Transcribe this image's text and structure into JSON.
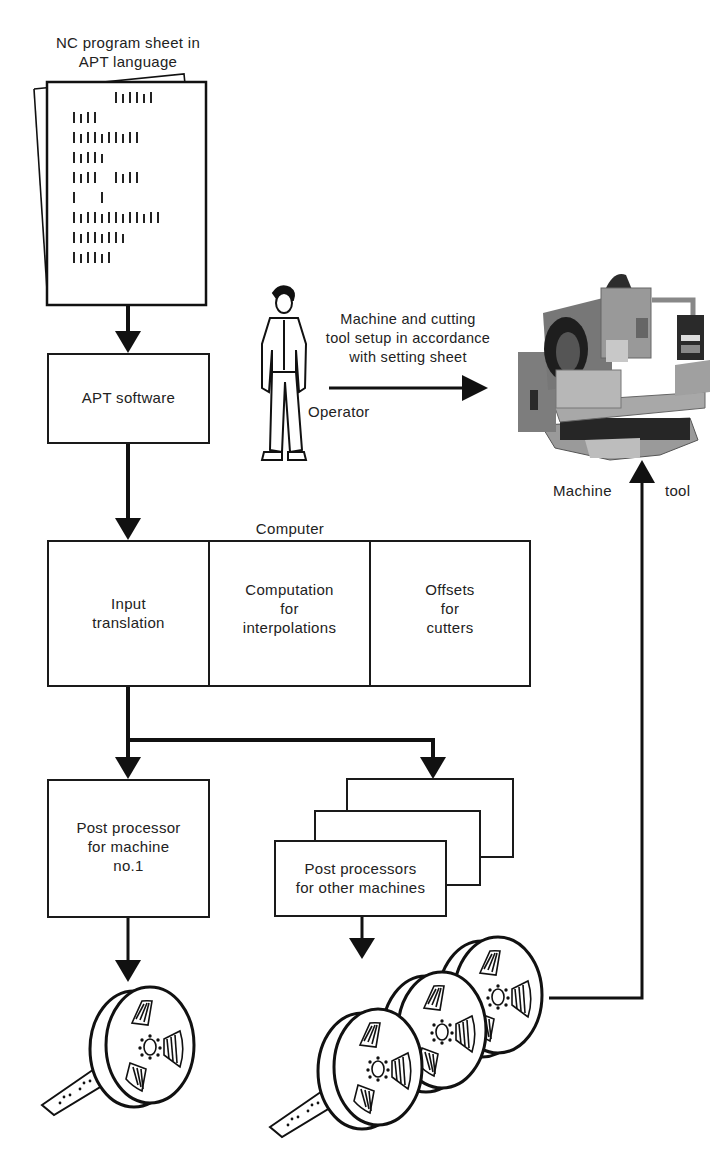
{
  "figure": {
    "program_sheet": {
      "title": "NC program sheet in\nAPT language",
      "code_lines": [
        {
          "indent": 6,
          "ticks": 6
        },
        {
          "indent": 0,
          "ticks": 4
        },
        {
          "indent": 0,
          "ticks": 10
        },
        {
          "indent": 0,
          "ticks": 5
        },
        {
          "indent": 0,
          "ticks": 4,
          "gap": 2,
          "ticks2": 4
        },
        {
          "indent": 0,
          "ticks": 1,
          "gap": 3,
          "ticks2": 1
        },
        {
          "indent": 0,
          "ticks": 13
        },
        {
          "indent": 0,
          "ticks": 8
        },
        {
          "indent": 0,
          "ticks": 6
        }
      ]
    },
    "apt_software": {
      "label": "APT software"
    },
    "operator": {
      "label": "Operator",
      "instruction": "Machine and cutting\ntool setup in accordance\nwith setting sheet",
      "icon": "person-icon"
    },
    "machine_tool": {
      "label_left": "Machine",
      "label_right": "tool",
      "icon": "cnc-machine-photo"
    },
    "computer": {
      "title": "Computer",
      "sections": [
        {
          "label": "Input\ntranslation"
        },
        {
          "label": "Computation\nfor\ninterpolations"
        },
        {
          "label": "Offsets\nfor\ncutters"
        }
      ]
    },
    "post_processor_1": {
      "label": "Post processor\nfor machine\nno.1"
    },
    "post_processors_other": {
      "label": "Post processors\nfor other machines",
      "stack_count": 3
    },
    "tape_reels": {
      "single_reel_count": 1,
      "multi_reel_count": 3,
      "icon": "punched-tape-reel-icon"
    },
    "colors": {
      "line": "#1a1a1a",
      "background": "#ffffff",
      "text": "#222222",
      "photo_mid": "#8a8a8a",
      "photo_dark": "#2e2e2e"
    }
  }
}
